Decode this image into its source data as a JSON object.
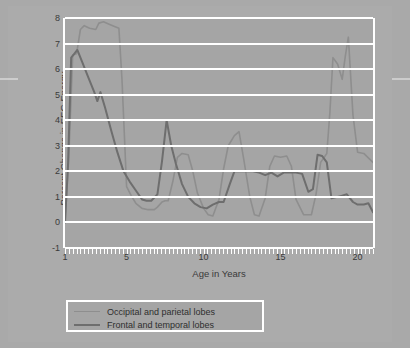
{
  "figure": {
    "background_color": "#a9a9a9",
    "plot_background_color": "#a5a5a5",
    "gridline_color": "#ffffff"
  },
  "chart_data": {
    "type": "line",
    "title": "",
    "xlabel": "Age in Years",
    "ylabel": "Percent Change in EEG Energy",
    "xlim": [
      1,
      21
    ],
    "ylim": [
      -1,
      8
    ],
    "ytick_labels": [
      "8",
      "7",
      "6",
      "5",
      "4",
      "3",
      "2",
      "1",
      "0",
      "-1"
    ],
    "ytick_values": [
      8,
      7,
      6,
      5,
      4,
      3,
      2,
      1,
      0,
      -1
    ],
    "xtick_labels": [
      "1",
      "5",
      "10",
      "15",
      "20"
    ],
    "xtick_values": [
      1,
      5,
      10,
      15,
      20
    ],
    "minor_xtick_interval": 0.25,
    "grid": "horizontal",
    "legend_position": "below-axes",
    "series": [
      {
        "name": "Occipital and parietal lobes",
        "color": "#8e8e8e",
        "x": [
          1.0,
          1.25,
          1.5,
          1.75,
          2.0,
          2.25,
          2.6,
          3.0,
          3.2,
          3.5,
          3.9,
          4.3,
          4.5,
          4.7,
          5.0,
          5.3,
          5.6,
          6.0,
          6.4,
          6.8,
          7.0,
          7.3,
          7.5,
          7.7,
          8.0,
          8.3,
          8.6,
          9.0,
          9.3,
          9.6,
          10.0,
          10.3,
          10.6,
          11.0,
          11.3,
          11.6,
          12.0,
          12.3,
          12.6,
          13.0,
          13.3,
          13.6,
          14.0,
          14.3,
          14.6,
          15.0,
          15.4,
          15.7,
          16.0,
          16.5,
          17.0,
          17.3,
          17.6,
          18.0,
          18.2,
          18.4,
          18.7,
          19.0,
          19.2,
          19.4,
          19.7,
          20.0,
          20.4,
          21.0
        ],
        "y": [
          0.0,
          2.6,
          6.55,
          6.6,
          7.55,
          7.7,
          7.6,
          7.55,
          7.8,
          7.85,
          7.75,
          7.65,
          7.6,
          5.6,
          1.4,
          1.05,
          0.75,
          0.55,
          0.5,
          0.5,
          0.6,
          0.8,
          0.85,
          0.85,
          1.6,
          2.55,
          2.7,
          2.65,
          2.0,
          1.15,
          0.55,
          0.3,
          0.25,
          0.9,
          2.1,
          3.0,
          3.4,
          3.55,
          2.5,
          1.0,
          0.3,
          0.25,
          0.95,
          2.2,
          2.6,
          2.55,
          2.6,
          2.2,
          0.9,
          0.3,
          0.3,
          1.1,
          2.35,
          2.7,
          4.3,
          6.45,
          6.2,
          5.6,
          6.5,
          7.25,
          4.2,
          2.75,
          2.7,
          2.35
        ]
      },
      {
        "name": "Frontal and temporal lobes",
        "color": "#6e6e6e",
        "x": [
          1.0,
          1.2,
          1.4,
          1.6,
          1.8,
          2.1,
          2.5,
          2.9,
          3.1,
          3.3,
          3.6,
          4.0,
          4.4,
          4.8,
          5.2,
          5.6,
          6.0,
          6.3,
          6.6,
          7.0,
          7.3,
          7.6,
          7.9,
          8.2,
          8.6,
          9.0,
          9.4,
          9.8,
          10.2,
          10.6,
          11.0,
          11.3,
          11.7,
          12.0,
          12.4,
          12.8,
          13.2,
          13.6,
          14.0,
          14.4,
          14.8,
          15.2,
          15.6,
          16.0,
          16.4,
          16.8,
          17.1,
          17.4,
          17.7,
          18.0,
          18.3,
          18.7,
          19.0,
          19.3,
          19.7,
          20.0,
          20.4,
          20.7,
          21.0
        ],
        "y": [
          0.0,
          2.3,
          6.45,
          6.6,
          6.75,
          6.3,
          5.7,
          5.1,
          4.75,
          5.1,
          4.5,
          3.6,
          2.75,
          2.0,
          1.6,
          1.25,
          0.9,
          0.85,
          0.85,
          1.1,
          2.4,
          4.0,
          3.0,
          2.3,
          1.5,
          1.0,
          0.75,
          0.6,
          0.55,
          0.7,
          0.8,
          0.8,
          1.5,
          2.0,
          2.0,
          2.0,
          2.0,
          1.95,
          1.85,
          1.95,
          1.8,
          1.95,
          1.95,
          1.95,
          1.9,
          1.2,
          1.3,
          2.65,
          2.6,
          2.35,
          0.95,
          1.0,
          1.05,
          1.1,
          0.8,
          0.7,
          0.7,
          0.75,
          0.4
        ]
      }
    ]
  },
  "legend": {
    "items": [
      {
        "label": "Occipital and parietal lobes",
        "color": "#8e8e8e",
        "line_width": 1.6
      },
      {
        "label": "Frontal and temporal lobes",
        "color": "#6e6e6e",
        "line_width": 2.2
      }
    ]
  }
}
